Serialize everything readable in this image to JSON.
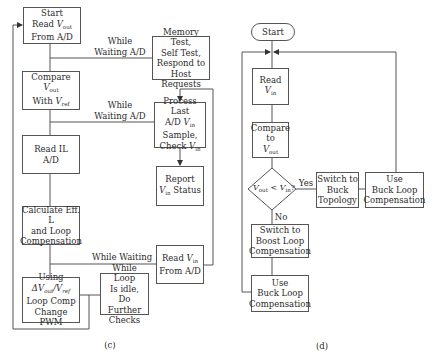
{
  "diagram_c": {
    "caption": "(c)",
    "boxes": {
      "start": {
        "l1": "Start",
        "l2a": "Read ",
        "l2v": "V",
        "l2s": "out",
        "l3": "From A/D"
      },
      "compare": {
        "l1a": "Compare ",
        "l1v": "V",
        "l1s": "out",
        "l2a": "With ",
        "l2v": "V",
        "l2s": "ref"
      },
      "read_il": {
        "l1": "Read IL",
        "l2": "A/D"
      },
      "calculate": {
        "l1": "Calculate Eff. L",
        "l2": "and Loop",
        "l3": "Compensation"
      },
      "using": {
        "l1": "Using",
        "l2a": "ΔV",
        "l2s": "out",
        "l2b": "/V",
        "l2s2": "ref",
        "l3": "Loop Comp",
        "l4": "Change PWM"
      },
      "memory": {
        "l1": "Memory Test,",
        "l2": "Self Test,",
        "l3": "Respond to",
        "l4": "Host Requests"
      },
      "process": {
        "l1": "Process Last",
        "l2a": "A/D ",
        "l2v": "V",
        "l2s": "in",
        "l3": "Sample,",
        "l4a": "Check ",
        "l4v": "V",
        "l4s": "in"
      },
      "report": {
        "l1": "Report",
        "l2v": "V",
        "l2s": "in",
        "l2b": " Status"
      },
      "read_vin": {
        "l1a": "Read ",
        "l1v": "V",
        "l1s": "in",
        "l2": "From A/D"
      },
      "while_loop": {
        "l1": "While Loop",
        "l2": "Is idle,",
        "l3": "Do Further",
        "l4": "Checks"
      }
    },
    "labels": {
      "wait1": {
        "l1": "While",
        "l2": "Waiting A/D"
      },
      "wait2": {
        "l1": "While",
        "l2": "Waiting A/D"
      },
      "wait3": "While Waiting"
    }
  },
  "diagram_d": {
    "caption": "(d)",
    "boxes": {
      "start": "Start",
      "read_vin": {
        "a": "Read ",
        "v": "V",
        "s": "in"
      },
      "compare": {
        "l1": "Compare",
        "l2": "to",
        "l3v": "V",
        "l3s": "out"
      },
      "decision": {
        "v1": "V",
        "s1": "out",
        "op": " < ",
        "v2": "V",
        "s2": "in",
        "q": "?"
      },
      "switch_buck": {
        "l1": "Switch to",
        "l2": "Buck",
        "l3": "Topology"
      },
      "use_buck_right": {
        "l1": "Use",
        "l2": "Buck Loop",
        "l3": "Compensation"
      },
      "switch_boost": {
        "l1": "Switch to",
        "l2": "Boost Loop",
        "l3": "Compensation"
      },
      "use_buck_bottom": {
        "l1": "Use",
        "l2": "Buck Loop",
        "l3": "Compensation"
      }
    },
    "labels": {
      "yes": "Yes",
      "no": "No"
    }
  },
  "colors": {
    "line": "#555555",
    "text": "#2a2a2a",
    "background": "#ffffff"
  }
}
